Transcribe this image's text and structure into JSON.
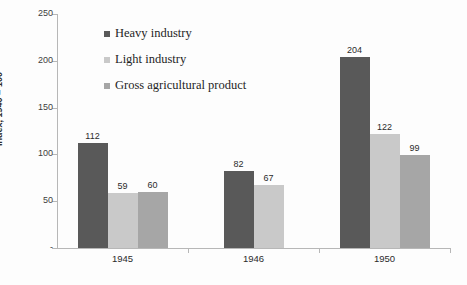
{
  "chart_data": {
    "type": "bar",
    "title": "",
    "subtitle": "",
    "xlabel": "",
    "ylabel": "Index, 1940 = 100",
    "categories": [
      "1945",
      "1946",
      "1950"
    ],
    "series": [
      {
        "name": "Heavy industry",
        "color": "#595959",
        "values": [
          112,
          82,
          204
        ]
      },
      {
        "name": "Light industry",
        "color": "#c9c9c9",
        "values": [
          59,
          67,
          122
        ]
      },
      {
        "name": "Gross agricultural product",
        "color": "#a6a6a6",
        "values": [
          60,
          null,
          99
        ]
      }
    ],
    "ylim": [
      0,
      250
    ],
    "yticks": [
      "-",
      "50",
      "100",
      "150",
      "200",
      "250"
    ],
    "ytick_values": [
      0,
      50,
      100,
      150,
      200,
      250
    ],
    "grid": false,
    "legend_position": "inside-top-left",
    "data_labels": [
      "112",
      "59",
      "60",
      "82",
      "67",
      "204",
      "122",
      "99"
    ]
  },
  "axis": {
    "y_title": "Index, 1940 = 100",
    "ticks": [
      {
        "label": "250",
        "value": 250
      },
      {
        "label": "200",
        "value": 200
      },
      {
        "label": "150",
        "value": 150
      },
      {
        "label": "100",
        "value": 100
      },
      {
        "label": "50",
        "value": 50
      },
      {
        "label": "-",
        "value": 0
      }
    ],
    "categories": [
      {
        "label": "1945"
      },
      {
        "label": "1946"
      },
      {
        "label": "1950"
      }
    ]
  },
  "legend": {
    "items": [
      {
        "label": "Heavy industry",
        "color": "#595959"
      },
      {
        "label": "Light industry",
        "color": "#c9c9c9"
      },
      {
        "label": "Gross agricultural product",
        "color": "#a6a6a6"
      }
    ]
  },
  "bars": [
    {
      "label": "112",
      "color": "#595959"
    },
    {
      "label": "59",
      "color": "#c9c9c9"
    },
    {
      "label": "60",
      "color": "#a6a6a6"
    },
    {
      "label": "82",
      "color": "#595959"
    },
    {
      "label": "67",
      "color": "#c9c9c9"
    },
    {
      "label": "204",
      "color": "#595959"
    },
    {
      "label": "122",
      "color": "#c9c9c9"
    },
    {
      "label": "99",
      "color": "#a6a6a6"
    }
  ]
}
